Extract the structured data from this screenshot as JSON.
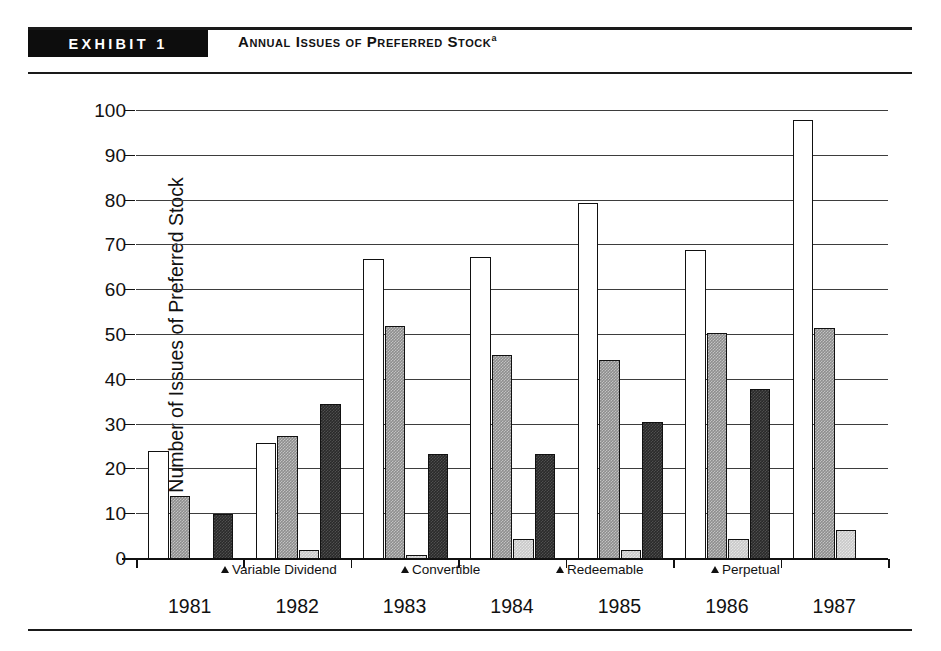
{
  "exhibit": {
    "band_label": "EXHIBIT 1",
    "title": "Annual Issues of Preferred Stock",
    "title_superscript": "a"
  },
  "chart_data": {
    "type": "bar",
    "title": "Annual Issues of Preferred Stock",
    "xlabel": "",
    "ylabel": "Number of Issues of Preferred Stock",
    "ylim": [
      0,
      100
    ],
    "yticks": [
      0,
      10,
      20,
      30,
      40,
      50,
      60,
      70,
      80,
      90,
      100
    ],
    "grid": true,
    "legend_position": "inside-bottom",
    "categories": [
      "1981",
      "1982",
      "1983",
      "1984",
      "1985",
      "1986",
      "1987"
    ],
    "series": [
      {
        "name": "Variable Dividend",
        "fill": "white",
        "color": "#ffffff",
        "values": [
          24,
          26,
          67,
          67.5,
          79.5,
          69,
          98
        ]
      },
      {
        "name": "Convertible",
        "fill": "medium-gray",
        "color": "#8e8e8e",
        "values": [
          14,
          27.5,
          52,
          45.5,
          44.5,
          50.5,
          51.5
        ]
      },
      {
        "name": "Perpetual",
        "fill": "light-gray",
        "color": "#c9c9c9",
        "values": [
          0,
          2,
          1,
          4.5,
          2,
          4.5,
          6.5
        ]
      },
      {
        "name": "Redeemable",
        "fill": "dark",
        "color": "#2a2a2a",
        "values": [
          10,
          34.5,
          23.5,
          23.5,
          30.5,
          38,
          0
        ]
      }
    ],
    "bar_order_in_group": [
      "Variable Dividend",
      "Convertible",
      "Perpetual",
      "Redeemable"
    ],
    "legend": [
      {
        "marker": "triangle",
        "label": "Variable Dividend"
      },
      {
        "marker": "triangle",
        "label": "Convertible"
      },
      {
        "marker": "triangle",
        "label": "Redeemable"
      },
      {
        "marker": "triangle",
        "label": "Perpetual"
      }
    ]
  }
}
